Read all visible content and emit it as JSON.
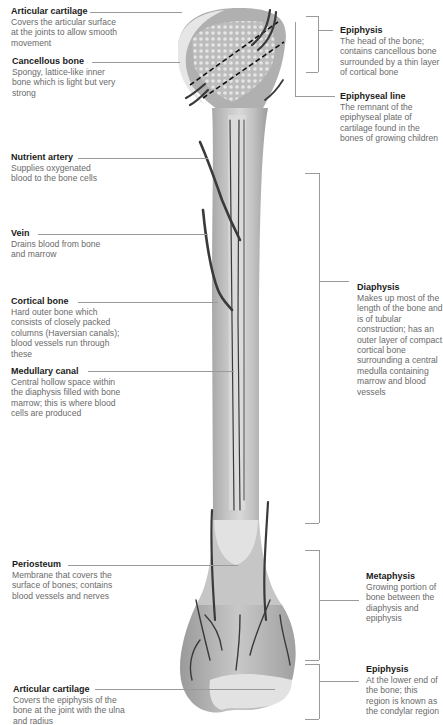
{
  "diagram": {
    "left_labels": [
      {
        "title": "Articular cartilage",
        "desc": "Covers the articular surface at the joints to allow smooth movement"
      },
      {
        "title": "Cancellous bone",
        "desc": "Spongy, lattice-like inner bone which is light but very strong"
      },
      {
        "title": "Nutrient artery",
        "desc": "Supplies oxygenated blood to the bone cells"
      },
      {
        "title": "Vein",
        "desc": "Drains blood from bone and marrow"
      },
      {
        "title": "Cortical bone",
        "desc": "Hard outer bone which consists of closely packed columns (Haversian canals); blood vessels run through these"
      },
      {
        "title": "Medullary canal",
        "desc": "Central hollow space within the diaphysis filled with bone marrow; this is where blood cells are produced"
      },
      {
        "title": "Periosteum",
        "desc": "Membrane that covers the surface of bones; contains blood vessels and nerves"
      },
      {
        "title": "Articular cartilage",
        "desc": "Covers the epiphysis of the bone at the joint with the ulna and radius"
      }
    ],
    "right_labels": [
      {
        "title": "Epiphysis",
        "desc": "The head of the bone; contains cancellous bone surrounded by a thin layer of cortical bone"
      },
      {
        "title": "Epiphyseal line",
        "desc": "The remnant of the epiphyseal plate of cartilage found in the bones of growing children"
      },
      {
        "title": "Diaphysis",
        "desc": "Makes up most of the length of the bone and is of tubular construction; has an outer layer of compact cortical bone surrounding a central medulla containing marrow and blood vessels"
      },
      {
        "title": "Metaphysis",
        "desc": "Growing portion of bone between the diaphysis and epiphysis"
      },
      {
        "title": "Epiphysis",
        "desc": "At the lower end of the bone; this region is known as the condylar region"
      }
    ],
    "colors": {
      "bone": "#b8b8b8",
      "bone_light": "#d6d6d6",
      "cartilage": "#e4e4e4",
      "vessel": "#3a3a3a",
      "leader_line": "#9a9a9a",
      "title_text": "#1a1a1a",
      "desc_text": "#6a6a6a"
    }
  }
}
